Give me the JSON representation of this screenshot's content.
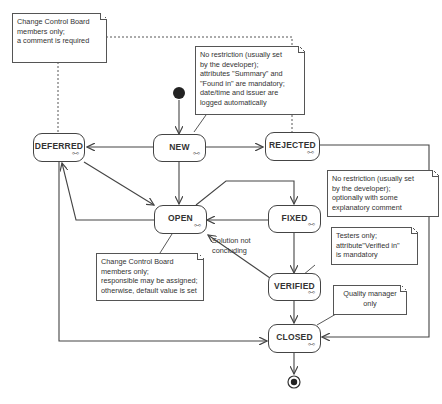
{
  "states": {
    "new": {
      "label": "NEW",
      "sub": "⧟"
    },
    "deferred": {
      "label": "DEFERRED",
      "sub": "⧟"
    },
    "rejected": {
      "label": "REJECTED",
      "sub": "⧟"
    },
    "open": {
      "label": "OPEN",
      "sub": "⧟"
    },
    "fixed": {
      "label": "FIXED",
      "sub": "⧟"
    },
    "verified": {
      "label": "VERIFIED",
      "sub": "⧟"
    },
    "closed": {
      "label": "CLOSED",
      "sub": "⧟"
    }
  },
  "notes": {
    "ccb_comment": [
      "Change Control Board",
      "members only;",
      "a comment is required"
    ],
    "new_restriction": [
      "No restriction (usually set",
      "by the developer);",
      "attributes \"Summary\" and",
      "\"Found in\" are mandatory;",
      "date/time and issuer are",
      "logged automatically"
    ],
    "fixed_restriction": [
      "No restriction (usually set",
      "by the developer);",
      "optionally with some",
      "explanatory comment"
    ],
    "ccb_assign": [
      "Change Control Board",
      "members only;",
      "responsible may be assigned;",
      "otherwise, default value is set"
    ],
    "testers": [
      "Testers only;",
      "attribute\"Verified in\"",
      "is mandatory"
    ],
    "quality_manager": [
      "Quality manager",
      "only"
    ]
  },
  "labels": {
    "solution_not_concluding": [
      "Solution not",
      "concluding"
    ]
  },
  "colors": {
    "line": "#444444",
    "note_border": "#555555",
    "background": "#ffffff"
  }
}
